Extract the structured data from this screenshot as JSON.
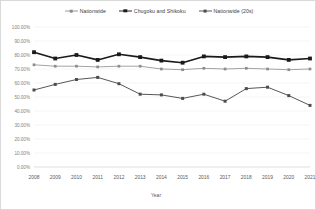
{
  "legend": {
    "items": [
      {
        "label": "Nationwide",
        "key": "nationwide",
        "color": "#8c8c8c"
      },
      {
        "label": "Chugoku and Shikoku",
        "key": "chugoku",
        "color": "#1a1a1a"
      },
      {
        "label": "Nationwide (20s)",
        "key": "twenties",
        "color": "#4d4d4d"
      }
    ]
  },
  "axes": {
    "x_title": "Year",
    "y_ticks": [
      "0.00%",
      "10.00%",
      "20.00%",
      "30.00%",
      "40.00%",
      "50.00%",
      "60.00%",
      "70.00%",
      "80.00%",
      "90.00%",
      "100.00%"
    ],
    "x_ticks": [
      "2008",
      "2009",
      "2010",
      "2011",
      "2012",
      "2013",
      "2014",
      "2015",
      "2016",
      "2017",
      "2018",
      "2019",
      "2020",
      "2021"
    ]
  },
  "chart_data": {
    "type": "line",
    "title": "",
    "xlabel": "Year",
    "ylabel": "",
    "ylim": [
      0,
      100
    ],
    "grid": true,
    "legend_position": "top",
    "categories": [
      "2008",
      "2009",
      "2010",
      "2011",
      "2012",
      "2013",
      "2014",
      "2015",
      "2016",
      "2017",
      "2018",
      "2019",
      "2020",
      "2021"
    ],
    "series": [
      {
        "name": "Nationwide",
        "color": "#8c8c8c",
        "values": [
          73.0,
          72.0,
          72.0,
          71.5,
          72.0,
          72.0,
          70.0,
          69.5,
          70.5,
          70.0,
          70.5,
          70.0,
          69.5,
          70.0
        ]
      },
      {
        "name": "Chugoku and Shikoku",
        "color": "#1a1a1a",
        "values": [
          82.0,
          77.5,
          80.0,
          76.5,
          80.5,
          78.5,
          76.0,
          74.5,
          79.0,
          78.5,
          79.0,
          78.5,
          76.5,
          77.5
        ]
      },
      {
        "name": "Nationwide (20s)",
        "color": "#4d4d4d",
        "values": [
          55.0,
          59.0,
          62.5,
          64.0,
          59.5,
          52.0,
          51.5,
          49.0,
          52.0,
          47.0,
          56.0,
          57.0,
          51.0,
          44.0
        ]
      }
    ]
  }
}
